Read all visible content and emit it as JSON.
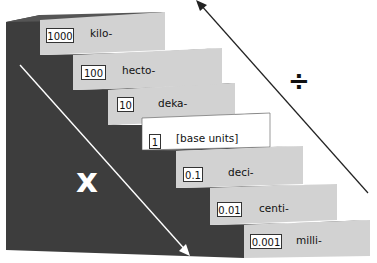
{
  "steps": [
    {
      "factor": "1000",
      "prefix": "kilo-"
    },
    {
      "factor": "100",
      "prefix": "hecto-"
    },
    {
      "factor": "10",
      "prefix": "deka-"
    },
    {
      "factor": "1",
      "prefix": "[base units]"
    },
    {
      "factor": "0.1",
      "prefix": "deci-"
    },
    {
      "factor": "0.01",
      "prefix": "centi-"
    },
    {
      "factor": "0.001",
      "prefix": "milli-"
    }
  ],
  "operations": {
    "down_symbol": "x",
    "up_symbol": "÷",
    "down_meaning": "multiply going down",
    "up_meaning": "divide going up"
  },
  "colors": {
    "side": "#3d3d3d",
    "tread_top": "#5a5a5a",
    "step_face": "#d2d2d2",
    "base_face": "#ffffff"
  }
}
